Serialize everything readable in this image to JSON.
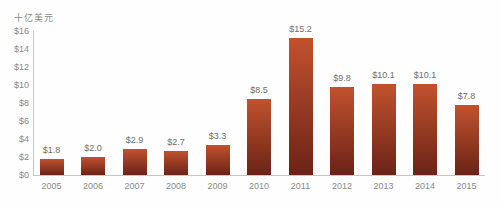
{
  "chart_data": {
    "type": "bar",
    "title": "",
    "unit_label": "十亿美元",
    "categories": [
      "2005",
      "2006",
      "2007",
      "2008",
      "2009",
      "2010",
      "2011",
      "2012",
      "2013",
      "2014",
      "2015"
    ],
    "values": [
      1.8,
      2.0,
      2.9,
      2.7,
      3.3,
      8.5,
      15.2,
      9.8,
      10.1,
      10.1,
      7.8
    ],
    "value_labels": [
      "$1.8",
      "$2.0",
      "$2.9",
      "$2.7",
      "$3.3",
      "$8.5",
      "$15.2",
      "$9.8",
      "$10.1",
      "$10.1",
      "$7.8"
    ],
    "yticks": [
      0,
      2,
      4,
      6,
      8,
      10,
      12,
      14,
      16
    ],
    "ytick_labels": [
      "$0",
      "$2",
      "$4",
      "$6",
      "$8",
      "$10",
      "$12",
      "$14",
      "$16"
    ],
    "ylim": [
      0,
      16
    ],
    "xlabel": "",
    "ylabel": "十亿美元",
    "grid": false,
    "legend": "none",
    "colors": {
      "bar_gradient_top": "#c1522e",
      "bar_gradient_bottom": "#6b2317",
      "axis_line": "#c6c6c6",
      "tick_text": "#8a8a8a",
      "value_text": "#6f6f6f",
      "unit_text": "#8a8a8a"
    }
  }
}
